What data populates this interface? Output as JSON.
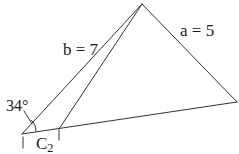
{
  "diagram": {
    "type": "triangle-ambiguous-case",
    "labels": {
      "side_b": "b = 7",
      "side_a": "a = 5",
      "angle": "34°",
      "vertex_c2_main": "C",
      "vertex_c2_sub": "2"
    },
    "points": {
      "apex": [
        142,
        4
      ],
      "left_vertex": [
        22,
        134
      ],
      "c2": [
        59,
        129
      ],
      "right_vertex": [
        237,
        102
      ]
    },
    "colors": {
      "stroke": "#333333",
      "text": "#1a1a1a",
      "background": "#ffffff"
    }
  }
}
